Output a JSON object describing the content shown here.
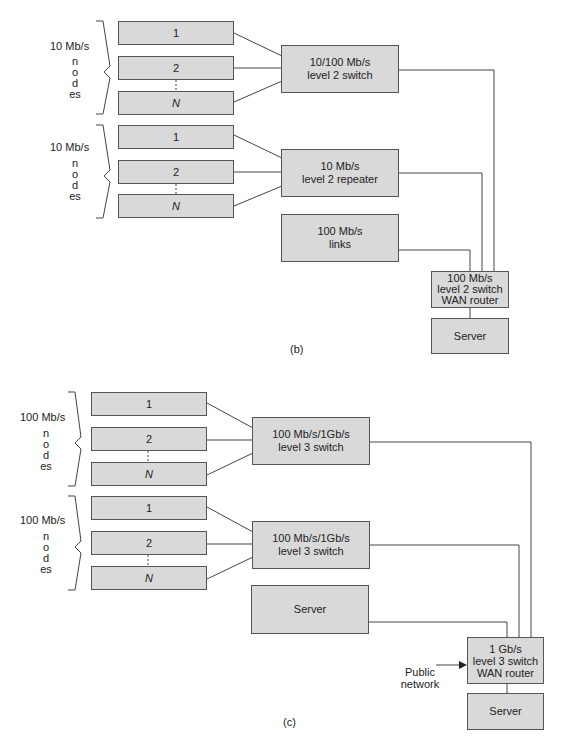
{
  "diagrams": [
    {
      "caption": "(b)",
      "groups": [
        {
          "speed": "10 Mb/s",
          "word": "nodes",
          "nodes": [
            "1",
            "2",
            "N"
          ]
        },
        {
          "speed": "10 Mb/s",
          "word": "nodes",
          "nodes": [
            "1",
            "2",
            "N"
          ]
        }
      ],
      "devices": {
        "switch_top": [
          "10/100 Mb/s",
          "level 2 switch"
        ],
        "switch_mid": [
          "10 Mb/s",
          "level 2 repeater"
        ],
        "links": [
          "100 Mb/s",
          "links"
        ],
        "router": [
          "100 Mb/s",
          "level 2 switch",
          "WAN router"
        ],
        "server": "Server"
      }
    },
    {
      "caption": "(c)",
      "groups": [
        {
          "speed": "100 Mb/s",
          "word": "nodes",
          "nodes": [
            "1",
            "2",
            "N"
          ]
        },
        {
          "speed": "100 Mb/s",
          "word": "nodes",
          "nodes": [
            "1",
            "2",
            "N"
          ]
        }
      ],
      "devices": {
        "switch_top": [
          "100 Mb/s/1Gb/s",
          "level 3 switch"
        ],
        "switch_mid": [
          "100 Mb/s/1Gb/s",
          "level 3 switch"
        ],
        "server_mid": "Server",
        "router": [
          "1 Gb/s",
          "level 3 switch",
          "WAN router"
        ],
        "server": "Server",
        "public_network": [
          "Public",
          "network"
        ]
      }
    }
  ]
}
